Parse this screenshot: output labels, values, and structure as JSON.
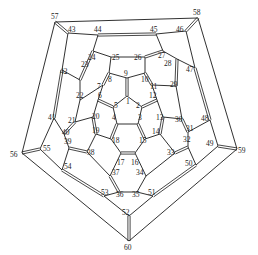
{
  "diagram": {
    "title": "",
    "type": "schlegel-diagram",
    "line_color": "#1a1a1a",
    "background": "#ffffff",
    "vertices": [
      {
        "id": 1,
        "x": 127,
        "y": 96,
        "lx": 126,
        "ly": 104
      },
      {
        "id": 2,
        "x": 142,
        "y": 107,
        "lx": 136,
        "ly": 108
      },
      {
        "id": 3,
        "x": 138,
        "y": 124,
        "lx": 138,
        "ly": 120
      },
      {
        "id": 4,
        "x": 117,
        "y": 124,
        "lx": 112,
        "ly": 120
      },
      {
        "id": 5,
        "x": 113,
        "y": 107,
        "lx": 114,
        "ly": 108
      },
      {
        "id": 6,
        "x": 98,
        "y": 100,
        "lx": 98,
        "ly": 98
      },
      {
        "id": 7,
        "x": 103,
        "y": 85,
        "lx": 97,
        "ly": 89
      },
      {
        "id": 8,
        "x": 109,
        "y": 73,
        "lx": 108,
        "ly": 82
      },
      {
        "id": 9,
        "x": 127,
        "y": 78,
        "lx": 124,
        "ly": 76
      },
      {
        "id": 10,
        "x": 145,
        "y": 73,
        "lx": 141,
        "ly": 82
      },
      {
        "id": 11,
        "x": 152,
        "y": 85,
        "lx": 150,
        "ly": 89
      },
      {
        "id": 12,
        "x": 157,
        "y": 100,
        "lx": 149,
        "ly": 98
      },
      {
        "id": 13,
        "x": 163,
        "y": 117,
        "lx": 156,
        "ly": 120
      },
      {
        "id": 14,
        "x": 160,
        "y": 134,
        "lx": 152,
        "ly": 134
      },
      {
        "id": 15,
        "x": 145,
        "y": 139,
        "lx": 139,
        "ly": 143
      },
      {
        "id": 16,
        "x": 135,
        "y": 153,
        "lx": 131,
        "ly": 165
      },
      {
        "id": 17,
        "x": 121,
        "y": 153,
        "lx": 117,
        "ly": 165
      },
      {
        "id": 18,
        "x": 111,
        "y": 139,
        "lx": 112,
        "ly": 143
      },
      {
        "id": 19,
        "x": 96,
        "y": 134,
        "lx": 92,
        "ly": 133
      },
      {
        "id": 20,
        "x": 93,
        "y": 117,
        "lx": 92,
        "ly": 119
      },
      {
        "id": 21,
        "x": 75,
        "y": 122,
        "lx": 68,
        "ly": 123
      },
      {
        "id": 22,
        "x": 80,
        "y": 100,
        "lx": 76,
        "ly": 98
      },
      {
        "id": 23,
        "x": 80,
        "y": 80,
        "lx": 81,
        "ly": 67
      },
      {
        "id": 24,
        "x": 93,
        "y": 51,
        "lx": 88,
        "ly": 60
      },
      {
        "id": 25,
        "x": 111,
        "y": 57,
        "lx": 112,
        "ly": 60
      },
      {
        "id": 26,
        "x": 145,
        "y": 57,
        "lx": 134,
        "ly": 60
      },
      {
        "id": 27,
        "x": 163,
        "y": 51,
        "lx": 158,
        "ly": 58
      },
      {
        "id": 28,
        "x": 177,
        "y": 59,
        "lx": 164,
        "ly": 66
      },
      {
        "id": 29,
        "x": 176,
        "y": 86,
        "lx": 170,
        "ly": 87
      },
      {
        "id": 30,
        "x": 182,
        "y": 119,
        "lx": 175,
        "ly": 122
      },
      {
        "id": 31,
        "x": 188,
        "y": 132,
        "lx": 186,
        "ly": 131
      },
      {
        "id": 32,
        "x": 188,
        "y": 147,
        "lx": 183,
        "ly": 142
      },
      {
        "id": 33,
        "x": 175,
        "y": 153,
        "lx": 167,
        "ly": 155
      },
      {
        "id": 34,
        "x": 146,
        "y": 176,
        "lx": 136,
        "ly": 175
      },
      {
        "id": 35,
        "x": 137,
        "y": 192,
        "lx": 132,
        "ly": 197
      },
      {
        "id": 36,
        "x": 119,
        "y": 192,
        "lx": 116,
        "ly": 197
      },
      {
        "id": 37,
        "x": 110,
        "y": 176,
        "lx": 112,
        "ly": 175
      },
      {
        "id": 38,
        "x": 87,
        "y": 152,
        "lx": 87,
        "ly": 155
      },
      {
        "id": 39,
        "x": 69,
        "y": 148,
        "lx": 64,
        "ly": 144
      },
      {
        "id": 40,
        "x": 64,
        "y": 134,
        "lx": 62,
        "ly": 135
      },
      {
        "id": 41,
        "x": 54,
        "y": 118,
        "lx": 48,
        "ly": 120
      },
      {
        "id": 42,
        "x": 62,
        "y": 70,
        "lx": 60,
        "ly": 74
      },
      {
        "id": 43,
        "x": 68,
        "y": 33,
        "lx": 68,
        "ly": 32
      },
      {
        "id": 44,
        "x": 98,
        "y": 35,
        "lx": 94,
        "ly": 32
      },
      {
        "id": 45,
        "x": 156,
        "y": 34,
        "lx": 150,
        "ly": 32
      },
      {
        "id": 46,
        "x": 186,
        "y": 31,
        "lx": 176,
        "ly": 32
      },
      {
        "id": 47,
        "x": 195,
        "y": 68,
        "lx": 186,
        "ly": 72
      },
      {
        "id": 48,
        "x": 210,
        "y": 120,
        "lx": 201,
        "ly": 121
      },
      {
        "id": 49,
        "x": 218,
        "y": 146,
        "lx": 206,
        "ly": 146
      },
      {
        "id": 50,
        "x": 196,
        "y": 165,
        "lx": 185,
        "ly": 166
      },
      {
        "id": 51,
        "x": 153,
        "y": 196,
        "lx": 148,
        "ly": 195
      },
      {
        "id": 52,
        "x": 129,
        "y": 216,
        "lx": 122,
        "ly": 215
      },
      {
        "id": 53,
        "x": 104,
        "y": 196,
        "lx": 101,
        "ly": 195
      },
      {
        "id": 54,
        "x": 62,
        "y": 170,
        "lx": 64,
        "ly": 169
      },
      {
        "id": 55,
        "x": 40,
        "y": 149,
        "lx": 43,
        "ly": 151
      },
      {
        "id": 56,
        "x": 22,
        "y": 153,
        "lx": 10,
        "ly": 157
      },
      {
        "id": 57,
        "x": 55,
        "y": 22,
        "lx": 51,
        "ly": 19
      },
      {
        "id": 58,
        "x": 198,
        "y": 18,
        "lx": 193,
        "ly": 15
      },
      {
        "id": 59,
        "x": 237,
        "y": 149,
        "lx": 238,
        "ly": 153
      },
      {
        "id": 60,
        "x": 129,
        "y": 241,
        "lx": 124,
        "ly": 250
      }
    ],
    "edges": [
      [
        1,
        2,
        0
      ],
      [
        2,
        3,
        0
      ],
      [
        3,
        4,
        0
      ],
      [
        4,
        5,
        0
      ],
      [
        5,
        1,
        0
      ],
      [
        1,
        9,
        1
      ],
      [
        2,
        12,
        1
      ],
      [
        3,
        15,
        1
      ],
      [
        4,
        18,
        1
      ],
      [
        5,
        6,
        1
      ],
      [
        6,
        7,
        0
      ],
      [
        7,
        8,
        1
      ],
      [
        8,
        9,
        0
      ],
      [
        9,
        10,
        0
      ],
      [
        10,
        11,
        1
      ],
      [
        11,
        12,
        0
      ],
      [
        12,
        13,
        0
      ],
      [
        13,
        14,
        1
      ],
      [
        14,
        15,
        0
      ],
      [
        15,
        16,
        0
      ],
      [
        16,
        17,
        1
      ],
      [
        17,
        18,
        0
      ],
      [
        18,
        19,
        0
      ],
      [
        19,
        20,
        1
      ],
      [
        20,
        6,
        0
      ],
      [
        7,
        22,
        0
      ],
      [
        8,
        25,
        0
      ],
      [
        10,
        26,
        0
      ],
      [
        11,
        29,
        0
      ],
      [
        13,
        30,
        0
      ],
      [
        14,
        33,
        0
      ],
      [
        16,
        34,
        0
      ],
      [
        17,
        37,
        0
      ],
      [
        19,
        38,
        0
      ],
      [
        20,
        21,
        0
      ],
      [
        21,
        22,
        0
      ],
      [
        22,
        23,
        0
      ],
      [
        23,
        24,
        1
      ],
      [
        24,
        25,
        0
      ],
      [
        25,
        26,
        0
      ],
      [
        26,
        27,
        1
      ],
      [
        27,
        28,
        0
      ],
      [
        28,
        29,
        1
      ],
      [
        29,
        30,
        0
      ],
      [
        30,
        31,
        1
      ],
      [
        31,
        32,
        0
      ],
      [
        32,
        33,
        1
      ],
      [
        33,
        34,
        0
      ],
      [
        34,
        35,
        0
      ],
      [
        35,
        36,
        0
      ],
      [
        36,
        37,
        1
      ],
      [
        37,
        38,
        0
      ],
      [
        38,
        39,
        1
      ],
      [
        39,
        40,
        0
      ],
      [
        40,
        21,
        1
      ],
      [
        23,
        42,
        0
      ],
      [
        24,
        44,
        0
      ],
      [
        27,
        45,
        0
      ],
      [
        28,
        47,
        0
      ],
      [
        31,
        48,
        0
      ],
      [
        32,
        50,
        0
      ],
      [
        35,
        51,
        0
      ],
      [
        36,
        53,
        0
      ],
      [
        39,
        54,
        0
      ],
      [
        40,
        41,
        0
      ],
      [
        41,
        42,
        1
      ],
      [
        42,
        43,
        0
      ],
      [
        43,
        44,
        0
      ],
      [
        44,
        45,
        1
      ],
      [
        45,
        46,
        0
      ],
      [
        46,
        47,
        0
      ],
      [
        47,
        48,
        1
      ],
      [
        48,
        49,
        0
      ],
      [
        49,
        50,
        0
      ],
      [
        50,
        51,
        1
      ],
      [
        51,
        52,
        0
      ],
      [
        52,
        53,
        0
      ],
      [
        53,
        54,
        1
      ],
      [
        54,
        55,
        0
      ],
      [
        55,
        41,
        0
      ],
      [
        43,
        57,
        1
      ],
      [
        46,
        58,
        1
      ],
      [
        49,
        59,
        1
      ],
      [
        52,
        60,
        1
      ],
      [
        55,
        56,
        1
      ],
      [
        56,
        57,
        0
      ],
      [
        57,
        58,
        0
      ],
      [
        58,
        59,
        0
      ],
      [
        59,
        60,
        0
      ],
      [
        60,
        56,
        0
      ]
    ]
  }
}
